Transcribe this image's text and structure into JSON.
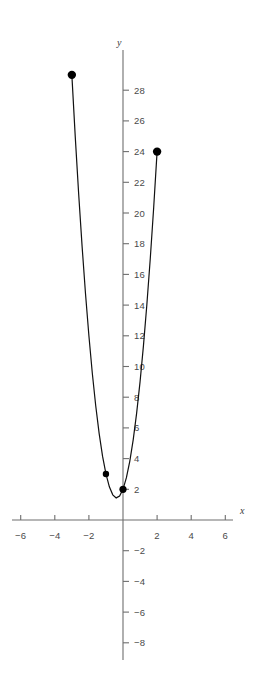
{
  "chart_data": {
    "type": "line",
    "title": "",
    "subtitle": "",
    "xlabel": "x",
    "ylabel": "y",
    "xlim": [
      -6.9,
      6.9
    ],
    "ylim": [
      -9.0,
      30.5
    ],
    "grid": false,
    "legend": null,
    "axis_style": "cartesian-cross",
    "x_ticks": [
      -6,
      -4,
      -2,
      2,
      4,
      6
    ],
    "x_tick_labels": [
      "−6",
      "−4",
      "−2",
      "2",
      "4",
      "6"
    ],
    "y_ticks": [
      -8,
      -6,
      -4,
      -2,
      2,
      4,
      6,
      8,
      10,
      12,
      14,
      16,
      18,
      20,
      22,
      24,
      26,
      28
    ],
    "y_tick_labels": [
      "−8",
      "−6",
      "−4",
      "−2",
      "2",
      "4",
      "6",
      "8",
      "10",
      "12",
      "14",
      "16",
      "18",
      "20",
      "22",
      "24",
      "26",
      "28"
    ],
    "series": [
      {
        "name": "parabola",
        "equation": "y = 4x^2 + 3x + 2",
        "color": "#111111",
        "domain": [
          -3.0,
          2.0
        ],
        "x": [
          -3.0,
          -2.8,
          -2.6,
          -2.4,
          -2.2,
          -2.0,
          -1.8,
          -1.6,
          -1.4,
          -1.2,
          -1.0,
          -0.8,
          -0.6,
          -0.4,
          -0.2,
          0.0,
          0.2,
          0.4,
          0.6,
          0.8,
          1.0,
          1.2,
          1.4,
          1.6,
          1.8,
          2.0
        ],
        "y": [
          29.0,
          24.96,
          21.24,
          17.84,
          14.76,
          12.0,
          9.56,
          7.44,
          5.64,
          4.16,
          3.0,
          2.16,
          1.64,
          1.44,
          1.56,
          2.0,
          2.76,
          3.84,
          5.24,
          6.96,
          9.0,
          11.36,
          14.04,
          17.04,
          20.36,
          24.0
        ]
      }
    ],
    "points": [
      {
        "name": "left-endpoint",
        "x": -3.0,
        "y": 29.0,
        "marker": "filled-circle",
        "size": 4.2
      },
      {
        "name": "point-left",
        "x": -1.0,
        "y": 3.0,
        "marker": "filled-circle",
        "size": 3.2
      },
      {
        "name": "vertex",
        "x": 0.0,
        "y": 2.0,
        "marker": "filled-circle",
        "size": 3.6
      },
      {
        "name": "right-endpoint",
        "x": 2.0,
        "y": 24.0,
        "marker": "filled-circle",
        "size": 4.2
      }
    ]
  },
  "axes": {
    "x_axis_label": "x",
    "y_axis_label": "y"
  }
}
